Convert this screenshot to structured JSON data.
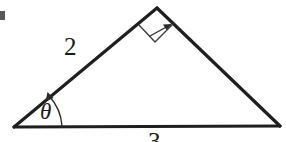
{
  "figure": {
    "background_color": "#ffffff",
    "stroke_color": "#1f1f1f",
    "label_color": "#1a1a1a",
    "width": 286,
    "height": 142
  },
  "labels": {
    "side_left": "2",
    "side_bottom": "3",
    "angle": "θ"
  },
  "geometry": {
    "vertices": {
      "left": {
        "x": 14,
        "y": 127
      },
      "apex": {
        "x": 157,
        "y": 8
      },
      "right": {
        "x": 280,
        "y": 126
      }
    },
    "right_angle_marker": {
      "at_vertex": "apex",
      "size": 26,
      "shape": "square"
    },
    "angle_arc": {
      "at_vertex": "left",
      "radius": 44,
      "arrow_end": "hypotenuse"
    }
  },
  "artifact": {
    "description": "scan speck at left edge",
    "x": 0,
    "y": 11,
    "width": 5,
    "height": 9,
    "color": "#3a3a3a"
  }
}
